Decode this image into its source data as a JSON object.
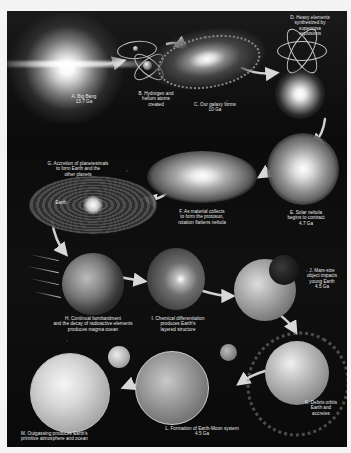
{
  "figure": {
    "title": "Formation of Earth",
    "background_color": "#0c0c0c",
    "page_color": "#f4f4f4"
  },
  "stages": [
    {
      "id": "A",
      "label": "A. Big Bang\n13.7 Ga"
    },
    {
      "id": "B",
      "label": "B. Hydrogen and\nhelium atoms\ncreated"
    },
    {
      "id": "C",
      "label": "C. Our galaxy forms\n10 Ga"
    },
    {
      "id": "D",
      "label": "D. Heavy elements\nsynthesized by\nsupernova\nexplosions"
    },
    {
      "id": "E",
      "label": "E. Solar nebula\nbegins to contract\n4.7 Ga"
    },
    {
      "id": "F",
      "label": "F. As material collects\nto form the protosun,\nrotation flattens nebula"
    },
    {
      "id": "G",
      "label": "G. Accretion of planetesimals\nto form Earth and the\nother planets"
    },
    {
      "id": "H",
      "label": "H. Continual bombardment\nand the decay of radioactive elements\nproduces magma ocean"
    },
    {
      "id": "I",
      "label": "I. Chemical differentiation\nproduces Earth's\nlayered structure"
    },
    {
      "id": "J",
      "label": "J. Mars-size\nobject impacts\nyoung Earth\n4.5 Ga"
    },
    {
      "id": "K",
      "label": "K. Debris orbits\nEarth and\naccretes"
    },
    {
      "id": "L",
      "label": "L. Formation of Earth-Moon system\n4.5 Ga"
    },
    {
      "id": "M",
      "label": "M. Outgassing produces Earth's\nprimitive atmosphere and ocean"
    }
  ],
  "annotations": {
    "earth_marker": "Earth"
  },
  "flow_order": [
    "A",
    "B",
    "C",
    "D",
    "E",
    "F",
    "G",
    "H",
    "I",
    "J",
    "K",
    "L",
    "M"
  ]
}
